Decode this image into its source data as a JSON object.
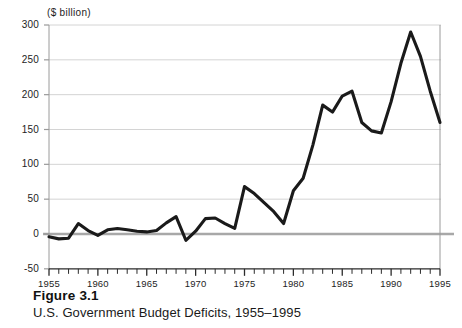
{
  "figure": {
    "number_label": "Figure 3.1",
    "caption": "U.S. Government Budget Deficits, 1955–1995"
  },
  "chart_data": {
    "type": "line",
    "title": "",
    "unit_label": "($ billion)",
    "xlabel": "",
    "ylabel": "($ billion)",
    "xlim": [
      1955,
      1995
    ],
    "ylim": [
      -50,
      300
    ],
    "ytick_values": [
      -50,
      0,
      50,
      100,
      150,
      200,
      250,
      300
    ],
    "ytick_labels": [
      "-50",
      "0",
      "50",
      "100",
      "150",
      "200",
      "250",
      "300"
    ],
    "xtick_values": [
      1955,
      1960,
      1965,
      1970,
      1975,
      1980,
      1985,
      1990,
      1995
    ],
    "xtick_labels": [
      "1955",
      "1960",
      "1965",
      "1970",
      "1975",
      "1980",
      "1985",
      "1990",
      "1995"
    ],
    "minor_xticks_every": 1,
    "grid": "horizontal",
    "zero_line": true,
    "legend": "none",
    "line_color": "#1a1a1a",
    "grid_color": "#d4d4d4",
    "zero_line_color": "#a8a8a8",
    "axis_color": "#9a9a9a",
    "x": [
      1955,
      1956,
      1957,
      1958,
      1959,
      1960,
      1961,
      1962,
      1963,
      1964,
      1965,
      1966,
      1967,
      1968,
      1969,
      1970,
      1971,
      1972,
      1973,
      1974,
      1975,
      1976,
      1977,
      1978,
      1979,
      1980,
      1981,
      1982,
      1983,
      1984,
      1985,
      1986,
      1987,
      1988,
      1989,
      1990,
      1991,
      1992,
      1993,
      1994,
      1995
    ],
    "values": [
      -4,
      -7,
      -6,
      15,
      5,
      -2,
      6,
      8,
      6,
      4,
      3,
      5,
      16,
      25,
      -9,
      4,
      22,
      23,
      15,
      8,
      68,
      58,
      45,
      32,
      15,
      62,
      80,
      128,
      185,
      175,
      198,
      205,
      160,
      148,
      145,
      190,
      245,
      290,
      255,
      205,
      160
    ],
    "series_name": "U.S. Federal Budget Deficit"
  }
}
